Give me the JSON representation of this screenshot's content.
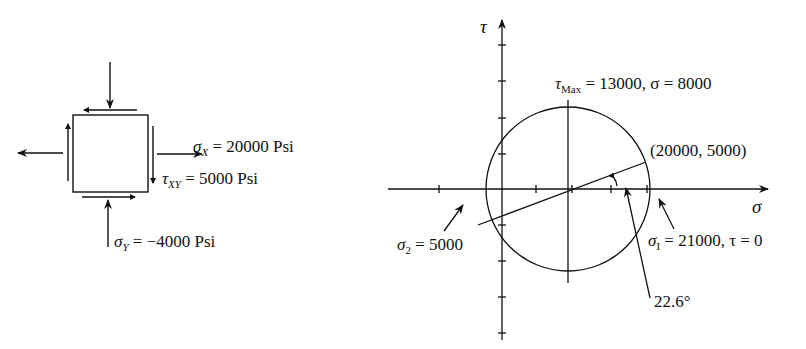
{
  "element": {
    "sigma_x": {
      "symbol": "σ",
      "sub": "X",
      "text": " = 20000 Psi"
    },
    "tau_xy": {
      "symbol": "τ",
      "sub": "XY",
      "text": " = 5000 Psi"
    },
    "sigma_y": {
      "symbol": "σ",
      "sub": "Y",
      "text": " = −4000 Psi"
    }
  },
  "mohr": {
    "tau_axis_label": "τ",
    "sigma_axis_label": "σ",
    "tau_max": {
      "symbol": "τ",
      "sub": "Max",
      "text": " = 13000, σ = 8000"
    },
    "point": "(20000, 5000)",
    "sigma_2": {
      "symbol": "σ",
      "sub": "2",
      "text": " = 5000"
    },
    "sigma_1": {
      "symbol": "σ",
      "sub": "I",
      "text": " = 21000, τ = 0"
    },
    "angle": "22.6°"
  },
  "colors": {
    "ink": "#111111",
    "background": "#ffffff"
  }
}
